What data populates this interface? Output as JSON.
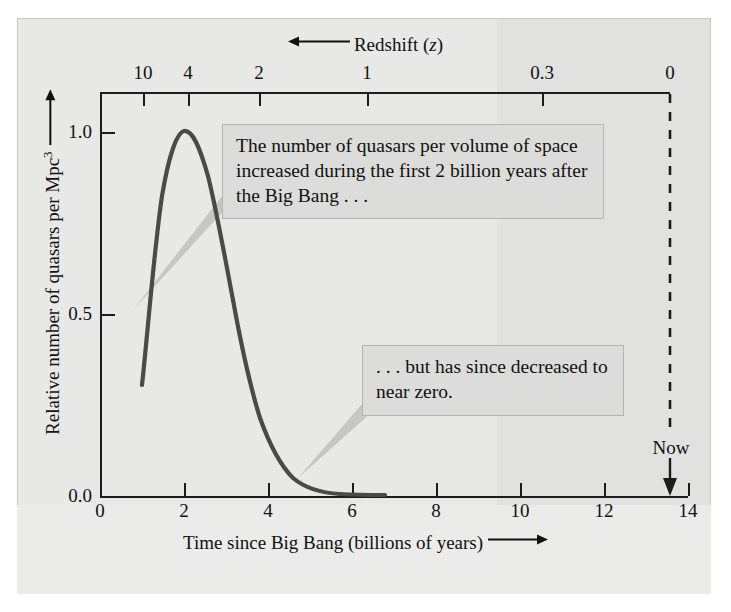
{
  "figure": {
    "background_color": "#e8e8e6",
    "curve_color": "#4a4a4a",
    "axis_color": "#1c1c1c",
    "callout_fill": "#dcdcda",
    "callout_border": "#b4b4b2",
    "leader_color": "#c6c6c4"
  },
  "chart_data": {
    "type": "line",
    "title": "",
    "xlabel": "Time since Big Bang (billions of years)",
    "ylabel": "Relative number of quasars per Mpc",
    "ylabel_exponent": "3",
    "top_axis_label": "Redshift (z)",
    "top_axis_symbol": "z",
    "top_axis_direction": "left",
    "xlabel_direction": "right",
    "ylabel_direction": "up",
    "xlim": [
      0,
      14
    ],
    "ylim": [
      0.0,
      1.22
    ],
    "grid": false,
    "legend": false,
    "x_ticks": [
      0,
      2,
      4,
      6,
      8,
      10,
      12,
      14
    ],
    "x_tick_labels": [
      "0",
      "2",
      "4",
      "6",
      "8",
      "10",
      "12",
      "14"
    ],
    "y_ticks": [
      0.0,
      0.5,
      1.0
    ],
    "y_tick_labels": [
      "0.0",
      "0.5",
      "1.0"
    ],
    "top_ticks": [
      {
        "label": "10",
        "time": 0.48
      },
      {
        "label": "4",
        "time": 1.57
      },
      {
        "label": "2",
        "time": 3.29
      },
      {
        "label": "1",
        "time": 5.94
      },
      {
        "label": "0.3",
        "time": 10.2
      },
      {
        "label": "0",
        "time": 13.7
      }
    ],
    "now_marker": {
      "label": "Now",
      "time": 13.7
    },
    "series": [
      {
        "name": "Relative quasar number density",
        "x": [
          1.15,
          1.35,
          1.55,
          1.75,
          1.95,
          2.15,
          2.35,
          2.55,
          2.75,
          2.95,
          3.2,
          3.45,
          3.7,
          4.0,
          4.3,
          4.7,
          5.1,
          5.6,
          6.1,
          6.6
        ],
        "values": [
          0.31,
          0.58,
          0.8,
          0.95,
          1.01,
          1.02,
          0.99,
          0.93,
          0.83,
          0.7,
          0.54,
          0.4,
          0.29,
          0.2,
          0.14,
          0.09,
          0.06,
          0.04,
          0.03,
          0.02
        ]
      }
    ],
    "annotations": [
      {
        "id": "callout-1",
        "text": "The number of quasars per volume of space increased during the first 2 billion years after the Big Bang . . .",
        "points_to": {
          "x": 2.0,
          "y": 0.52
        }
      },
      {
        "id": "callout-2",
        "text": ". . . but has since decreased to near zero.",
        "points_to": {
          "x": 4.6,
          "y": 0.1
        }
      }
    ]
  }
}
